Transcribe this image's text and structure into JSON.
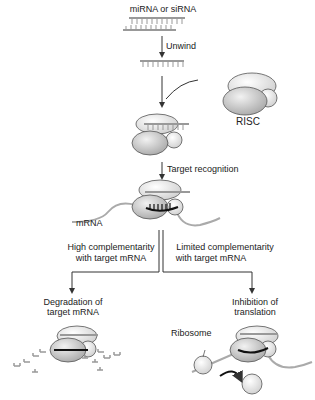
{
  "title": "miRNA or siRNA",
  "steps": {
    "unwind": "Unwind",
    "risc": "RISC",
    "target_recognition": "Target recognition",
    "mrna": "mRNA"
  },
  "branches": {
    "left": {
      "condition_line1": "High complementarity",
      "condition_line2": "with target mRNA",
      "outcome_line1": "Degradation of",
      "outcome_line2": "target mRNA"
    },
    "right": {
      "condition_line1": "Limited complementarity",
      "condition_line2": "with target mRNA",
      "outcome_line1": "Inhibition of",
      "outcome_line2": "translation",
      "ribosome": "Ribosome"
    }
  },
  "colors": {
    "rna": "#9a9a9a",
    "protein_light": "#e8e8e8",
    "protein_dark": "#bdbdbd",
    "arrow": "#333333",
    "mrna_binding": "#111111"
  }
}
